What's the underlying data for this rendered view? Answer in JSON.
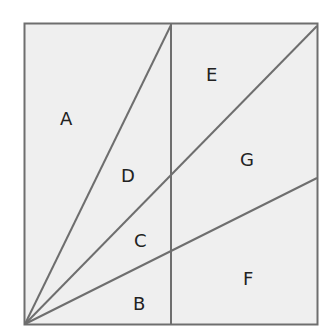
{
  "diagram": {
    "colors": {
      "fill": "#efefef",
      "stroke": "#6e6e6e",
      "text": "#222222"
    },
    "labels": [
      {
        "id": "A",
        "text": "A",
        "x": 67,
        "y": 125
      },
      {
        "id": "B",
        "text": "B",
        "x": 139,
        "y": 310
      },
      {
        "id": "C",
        "text": "C",
        "x": 141,
        "y": 247
      },
      {
        "id": "D",
        "text": "D",
        "x": 129,
        "y": 182
      },
      {
        "id": "E",
        "text": "E",
        "x": 212,
        "y": 81
      },
      {
        "id": "F",
        "text": "F",
        "x": 248,
        "y": 285
      },
      {
        "id": "G",
        "text": "G",
        "x": 248,
        "y": 166
      }
    ]
  }
}
